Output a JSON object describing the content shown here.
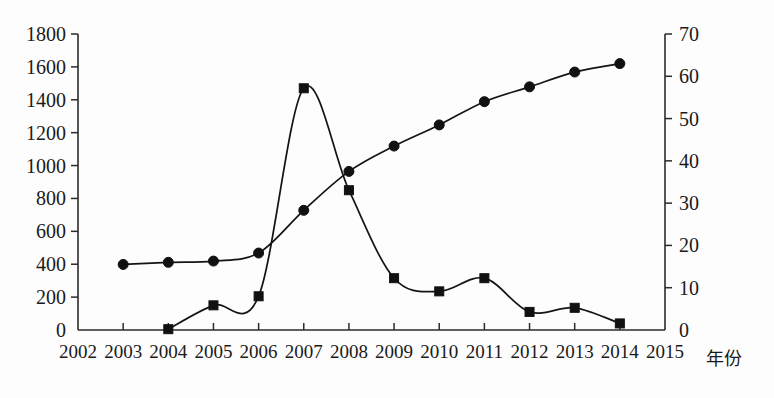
{
  "chart_data": {
    "type": "line",
    "title": "",
    "subtitle": "",
    "xlabel": "年份",
    "ylabel": "",
    "y2label": "",
    "grid": false,
    "legend_position": "none",
    "x": [
      2003,
      2004,
      2005,
      2006,
      2007,
      2008,
      2009,
      2010,
      2011,
      2012,
      2013,
      2014
    ],
    "x_axis": {
      "ticks": [
        "2002",
        "2003",
        "2004",
        "2005",
        "2006",
        "2007",
        "2008",
        "2009",
        "2010",
        "2011",
        "2012",
        "2013",
        "2014",
        "2015"
      ],
      "min": 2002,
      "max": 2015,
      "caption": "年份"
    },
    "y_axis_left": {
      "ticks": [
        "0",
        "200",
        "400",
        "600",
        "800",
        "1000",
        "1200",
        "1400",
        "1600",
        "1800"
      ],
      "min": 0,
      "max": 1800,
      "step": 200
    },
    "y_axis_right": {
      "ticks": [
        "0",
        "10",
        "20",
        "30",
        "40",
        "50",
        "60",
        "70"
      ],
      "min": 0,
      "max": 70,
      "step": 10
    },
    "series": [
      {
        "name": "series-squares",
        "marker": "square",
        "axis": "left",
        "color": "#111111",
        "x": [
          2004,
          2005,
          2006,
          2007,
          2008,
          2009,
          2010,
          2011,
          2012,
          2013,
          2014
        ],
        "values": [
          5,
          150,
          205,
          1470,
          850,
          315,
          235,
          315,
          110,
          135,
          40
        ]
      },
      {
        "name": "series-circles",
        "marker": "circle",
        "axis": "right",
        "color": "#111111",
        "x": [
          2003,
          2004,
          2005,
          2006,
          2007,
          2008,
          2009,
          2010,
          2011,
          2012,
          2013,
          2014
        ],
        "values": [
          15.5,
          16,
          16.3,
          18.2,
          28.3,
          37.5,
          43.5,
          48.5,
          54,
          57.5,
          61,
          63
        ]
      }
    ]
  }
}
